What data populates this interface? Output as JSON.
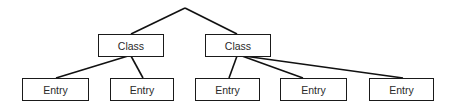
{
  "diagram": {
    "type": "tree",
    "root": {
      "label": ""
    },
    "classes": [
      {
        "label": "Class"
      },
      {
        "label": "Class"
      }
    ],
    "entries": [
      {
        "label": "Entry",
        "parent": 0
      },
      {
        "label": "Entry",
        "parent": 0
      },
      {
        "label": "Entry",
        "parent": 1
      },
      {
        "label": "Entry",
        "parent": 1
      },
      {
        "label": "Entry",
        "parent": 1
      }
    ],
    "colors": {
      "stroke": "#111111",
      "text": "#2a2a2a",
      "background": "#ffffff"
    }
  }
}
